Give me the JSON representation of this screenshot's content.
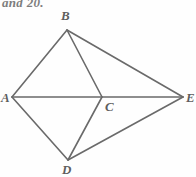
{
  "document": {
    "caption_fragment": "and 20.",
    "caption_note": "partially cropped italic text at top edge"
  },
  "figure": {
    "name": "kite-diagram-abcde",
    "background_color": "#fefefe",
    "stroke_color": "#6a6a6a",
    "label_color": "#5e5e5e",
    "stroke_width": 1.6,
    "vertices": [
      {
        "id": "A",
        "label": "A",
        "x": 12,
        "y": 97,
        "label_x": 1,
        "label_y": 91
      },
      {
        "id": "B",
        "label": "B",
        "x": 67,
        "y": 30,
        "label_x": 61,
        "label_y": 9
      },
      {
        "id": "C",
        "label": "C",
        "x": 102,
        "y": 97,
        "label_x": 105,
        "label_y": 100
      },
      {
        "id": "D",
        "label": "D",
        "x": 68,
        "y": 160,
        "label_x": 62,
        "label_y": 163
      },
      {
        "id": "E",
        "label": "E",
        "x": 183,
        "y": 97,
        "label_x": 186,
        "label_y": 91
      }
    ],
    "edges": [
      {
        "name": "segment-AB",
        "from": "A",
        "to": "B"
      },
      {
        "name": "segment-BE",
        "from": "B",
        "to": "E"
      },
      {
        "name": "segment-AD",
        "from": "A",
        "to": "D"
      },
      {
        "name": "segment-DE",
        "from": "D",
        "to": "E"
      },
      {
        "name": "segment-AE-diagonal",
        "from": "A",
        "to": "E"
      },
      {
        "name": "segment-BC",
        "from": "B",
        "to": "C"
      },
      {
        "name": "segment-CD",
        "from": "C",
        "to": "D"
      }
    ]
  }
}
